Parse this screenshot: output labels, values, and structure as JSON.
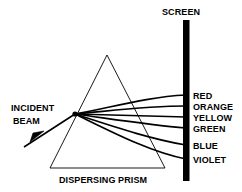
{
  "figure": {
    "title_label": "SCREEN",
    "incident_label_line1": "INCIDENT",
    "incident_label_line2": "BEAM",
    "prism_label": "DISPERSING PRISM",
    "stroke_color": "#000000",
    "background_color": "#ffffff",
    "screen_color": "#000000"
  },
  "spectrum": {
    "bands": [
      {
        "name": "red",
        "label": "RED",
        "screen_y": 95
      },
      {
        "name": "orange",
        "label": "ORANGE",
        "screen_y": 106
      },
      {
        "name": "yellow",
        "label": "YELLOW",
        "screen_y": 117
      },
      {
        "name": "green",
        "label": "GREEN",
        "screen_y": 128
      },
      {
        "name": "blue",
        "label": "BLUE",
        "screen_y": 145
      },
      {
        "name": "violet",
        "label": "VIOLET",
        "screen_y": 159
      }
    ]
  },
  "geometry": {
    "prism_apex_x": 107,
    "prism_apex_y": 55,
    "prism_base_left_x": 50,
    "prism_base_right_x": 165,
    "prism_base_y": 168,
    "refraction_point_x": 75,
    "refraction_point_y": 114,
    "incident_start_x": 24,
    "incident_start_y": 147,
    "screen_x": 186,
    "screen_top_y": 20,
    "screen_bottom_y": 181
  }
}
